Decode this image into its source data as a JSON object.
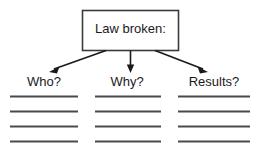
{
  "diagram": {
    "type": "graphic-organizer",
    "title_box": {
      "label": "Law broken:",
      "border_color": "#3a3a3a",
      "fill_color": "#ffffff"
    },
    "connector": {
      "style": "arrow",
      "color": "#1a1a1a",
      "count": 3
    },
    "branches": [
      {
        "label": "Who?",
        "write_lines": 4
      },
      {
        "label": "Why?",
        "write_lines": 4
      },
      {
        "label": "Results?",
        "write_lines": 4
      }
    ],
    "line_color": "#4a4a4a",
    "background_color": "#ffffff"
  }
}
